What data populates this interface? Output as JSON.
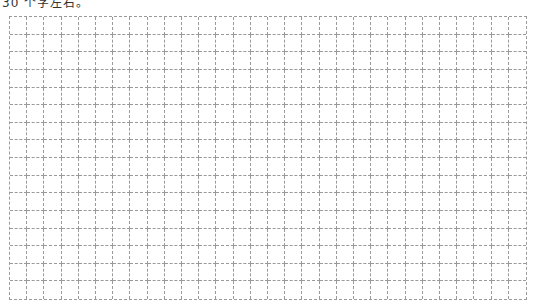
{
  "header": {
    "text": "30 个字左右。"
  },
  "grid": {
    "columns": 30,
    "rows": 16,
    "line_color": "#9a9a9a",
    "line_style": "dashed",
    "cells_filled": []
  }
}
